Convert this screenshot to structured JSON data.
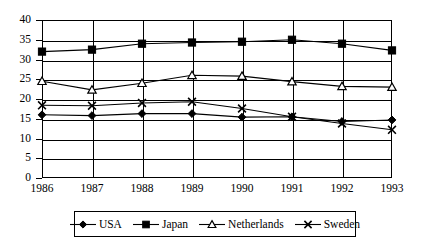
{
  "chart_data": {
    "type": "line",
    "title": "",
    "subtitle": "",
    "xlabel": "",
    "ylabel": "",
    "categories": [
      "1986",
      "1987",
      "1988",
      "1989",
      "1990",
      "1991",
      "1992",
      "1993"
    ],
    "x": [
      1986,
      1987,
      1988,
      1989,
      1990,
      1991,
      1992,
      1993
    ],
    "ylim": [
      0,
      40
    ],
    "yticks": [
      0,
      5,
      10,
      15,
      20,
      25,
      30,
      35,
      40
    ],
    "ytick_labels": [
      "0",
      "5",
      "10",
      "15",
      "20",
      "25",
      "30",
      "35",
      "40"
    ],
    "grid": true,
    "grid_axis": "both",
    "legend_position": "bottom",
    "series": [
      {
        "name": "USA",
        "marker": "filled-diamond",
        "color": "#000000",
        "values": [
          16.0,
          15.8,
          16.3,
          16.3,
          15.4,
          15.5,
          14.3,
          14.7
        ]
      },
      {
        "name": "Japan",
        "marker": "filled-square",
        "color": "#000000",
        "values": [
          32.0,
          32.5,
          34.0,
          34.3,
          34.5,
          35.0,
          34.0,
          32.3
        ]
      },
      {
        "name": "Netherlands",
        "marker": "open-triangle",
        "color": "#000000",
        "values": [
          24.5,
          22.3,
          24.0,
          26.0,
          25.8,
          24.4,
          23.2,
          23.0
        ]
      },
      {
        "name": "Sweden",
        "marker": "cross-x",
        "color": "#000000",
        "values": [
          18.4,
          18.3,
          19.0,
          19.3,
          17.6,
          15.5,
          13.8,
          12.2
        ]
      }
    ]
  },
  "legend": {
    "items": [
      {
        "label": "USA",
        "marker": "filled-diamond"
      },
      {
        "label": "Japan",
        "marker": "filled-square"
      },
      {
        "label": "Netherlands",
        "marker": "open-triangle"
      },
      {
        "label": "Sweden",
        "marker": "cross-x"
      }
    ]
  }
}
